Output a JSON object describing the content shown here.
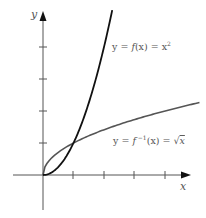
{
  "chart_data": {
    "type": "line",
    "title": "",
    "xlabel": "x",
    "ylabel": "y",
    "xlim": [
      -1,
      5.2
    ],
    "ylim": [
      -1,
      5
    ],
    "grid": false,
    "x_ticks": [
      1,
      2,
      3,
      4
    ],
    "y_ticks": [
      1,
      2,
      3,
      4
    ],
    "series": [
      {
        "name": "y = f(x) = x²",
        "function": "x^2",
        "domain": [
          0,
          2.27
        ],
        "color": "#111111",
        "points": [
          [
            0,
            0
          ],
          [
            0.5,
            0.25
          ],
          [
            1,
            1
          ],
          [
            1.5,
            2.25
          ],
          [
            2,
            4
          ],
          [
            2.27,
            5.15
          ]
        ]
      },
      {
        "name": "y = f⁻¹(x) = √x",
        "function": "sqrt(x)",
        "domain": [
          0,
          5.13
        ],
        "color": "#555555",
        "points": [
          [
            0,
            0
          ],
          [
            0.25,
            0.5
          ],
          [
            1,
            1
          ],
          [
            2,
            1.41
          ],
          [
            3,
            1.73
          ],
          [
            4,
            2
          ],
          [
            5.13,
            2.27
          ]
        ]
      }
    ],
    "annotations": [
      {
        "text": "y = f(x) = x²",
        "near_series": 0
      },
      {
        "text": "y = f⁻¹(x) = √x",
        "near_series": 1
      }
    ],
    "intersection": [
      1,
      1
    ]
  },
  "labels": {
    "x_axis": "x",
    "y_axis": "y",
    "f_label_prefix": "y = ",
    "f_label_f": "f",
    "f_label_mid": "(x) = x",
    "f_label_sup": "2",
    "finv_label_prefix": "y = ",
    "finv_label_f": "f",
    "finv_label_sup": " −1",
    "finv_label_mid": "(x) = ",
    "finv_label_sqrt": "√",
    "finv_label_x": "x"
  }
}
